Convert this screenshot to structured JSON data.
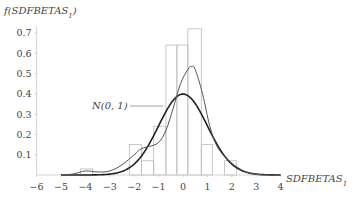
{
  "chart_data": {
    "type": "bar",
    "title": "",
    "xlabel": "SDFBETAS",
    "xlabel_subscript": "1",
    "ylabel": "f(SDFBETAS",
    "ylabel_subscript": "1",
    "ylabel_suffix": ")",
    "xlim": [
      -6,
      4
    ],
    "ylim": [
      0,
      0.75
    ],
    "x_ticks": [
      -6,
      -5,
      -4,
      -3,
      -2,
      -1,
      0,
      1,
      2,
      3,
      4
    ],
    "x_tick_labels": [
      "−6",
      "−5",
      "−4",
      "−3",
      "−2",
      "−1",
      "0",
      "1",
      "2",
      "3",
      "4"
    ],
    "y_ticks": [
      0.1,
      0.2,
      0.3,
      0.4,
      0.5,
      0.6,
      0.7
    ],
    "y_tick_labels": [
      "0.1",
      "0.2",
      "0.3",
      "0.4",
      "0.5",
      "0.6",
      "0.7"
    ],
    "grid": false,
    "legend": "none",
    "histogram": {
      "bins": [
        {
          "x0": -4.2,
          "x1": -3.7,
          "height": 0.03
        },
        {
          "x0": -2.2,
          "x1": -1.7,
          "height": 0.15
        },
        {
          "x0": -1.7,
          "x1": -1.2,
          "height": 0.07
        },
        {
          "x0": -1.2,
          "x1": -0.7,
          "height": 0.24
        },
        {
          "x0": -0.7,
          "x1": -0.25,
          "height": 0.64
        },
        {
          "x0": -0.25,
          "x1": 0.2,
          "height": 0.64
        },
        {
          "x0": 0.2,
          "x1": 0.75,
          "height": 0.72
        },
        {
          "x0": 0.75,
          "x1": 1.2,
          "height": 0.15
        },
        {
          "x0": 1.2,
          "x1": 1.7,
          "height": 0.0
        },
        {
          "x0": 1.7,
          "x1": 2.2,
          "height": 0.07
        }
      ]
    },
    "series": [
      {
        "name": "N(0,1)",
        "kind": "normal-density",
        "mean": 0,
        "sd": 1,
        "style": "thick-dark"
      },
      {
        "name": "kernel density",
        "kind": "kde",
        "points": [
          [
            -5.0,
            0.0
          ],
          [
            -4.5,
            0.005
          ],
          [
            -4.0,
            0.02
          ],
          [
            -3.5,
            0.015
          ],
          [
            -3.0,
            0.02
          ],
          [
            -2.5,
            0.05
          ],
          [
            -2.0,
            0.1
          ],
          [
            -1.7,
            0.13
          ],
          [
            -1.4,
            0.14
          ],
          [
            -1.0,
            0.16
          ],
          [
            -0.7,
            0.22
          ],
          [
            -0.4,
            0.33
          ],
          [
            -0.1,
            0.45
          ],
          [
            0.2,
            0.52
          ],
          [
            0.35,
            0.535
          ],
          [
            0.5,
            0.52
          ],
          [
            0.8,
            0.4
          ],
          [
            1.1,
            0.24
          ],
          [
            1.4,
            0.14
          ],
          [
            1.8,
            0.08
          ],
          [
            2.2,
            0.04
          ],
          [
            2.6,
            0.015
          ],
          [
            3.0,
            0.003
          ],
          [
            3.5,
            0.0
          ],
          [
            4.0,
            0.0
          ]
        ],
        "style": "thin-gray"
      }
    ],
    "annotations": [
      {
        "text": "N(0, 1)",
        "x": -3.7,
        "y": 0.34,
        "points_to": "N(0,1) curve"
      }
    ]
  },
  "labels": {
    "ylabel_prefix": "f(SDFBETAS",
    "ylabel_sub": "1",
    "ylabel_close": ")",
    "xlabel": "SDFBETAS",
    "xlabel_sub": "1",
    "annotation": "N(0, 1)"
  }
}
